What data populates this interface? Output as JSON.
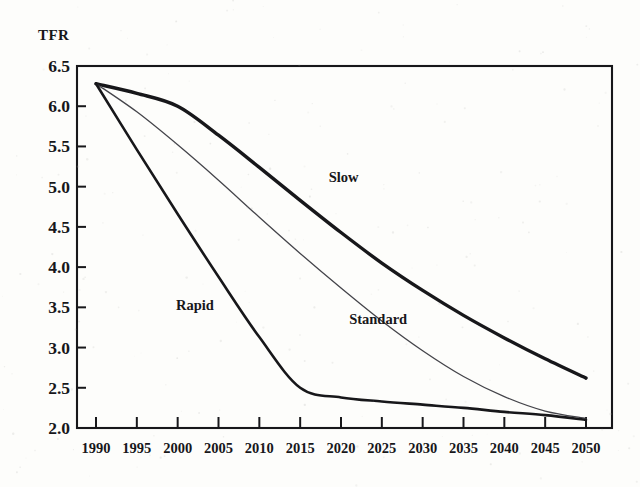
{
  "figure": {
    "background_color": "#fdfdfb",
    "ink_color": "#17171a",
    "axis_title": "TFR"
  },
  "chart_data": {
    "type": "line",
    "title": "",
    "subtitle": "",
    "xlabel": "",
    "ylabel": "TFR",
    "axis_title_position": "top-left",
    "grid": false,
    "legend": "inline-annotations",
    "xlim": [
      1990,
      2050
    ],
    "ylim": [
      2.0,
      6.5
    ],
    "x_ticks": [
      1990,
      1995,
      2000,
      2005,
      2010,
      2015,
      2020,
      2025,
      2030,
      2035,
      2040,
      2045,
      2050
    ],
    "x_tick_labels": [
      "1990",
      "1995",
      "2000",
      "2005",
      "2010",
      "2015",
      "2020",
      "2025",
      "2030",
      "2035",
      "2040",
      "2045",
      "2050"
    ],
    "y_ticks": [
      2.0,
      2.5,
      3.0,
      3.5,
      4.0,
      4.5,
      5.0,
      5.5,
      6.0,
      6.5
    ],
    "y_tick_labels": [
      "2.0",
      "2.5",
      "3.0",
      "3.5",
      "4.0",
      "4.5",
      "5.0",
      "5.5",
      "6.0",
      "6.5"
    ],
    "x": [
      1990,
      1995,
      2000,
      2005,
      2010,
      2015,
      2020,
      2025,
      2030,
      2035,
      2040,
      2045,
      2050
    ],
    "series": [
      {
        "name": "Slow",
        "label": "Slow",
        "style": "thick-solid",
        "line_width": 3.4,
        "color": "#17171a",
        "label_x": 2018.5,
        "label_y": 5.06,
        "values": [
          6.28,
          6.16,
          6.0,
          5.64,
          5.24,
          4.83,
          4.43,
          4.05,
          3.71,
          3.4,
          3.12,
          2.86,
          2.62
        ]
      },
      {
        "name": "Standard",
        "label": "Standard",
        "style": "thin-solid",
        "line_width": 1.3,
        "color": "#44444a",
        "label_x": 2021.0,
        "label_y": 3.29,
        "values": [
          6.28,
          5.93,
          5.52,
          5.08,
          4.62,
          4.17,
          3.74,
          3.33,
          2.96,
          2.64,
          2.39,
          2.21,
          2.12
        ]
      },
      {
        "name": "Rapid",
        "label": "Rapid",
        "style": "medium-solid",
        "line_width": 2.6,
        "color": "#17171a",
        "label_x": 1999.8,
        "label_y": 3.47,
        "values": [
          6.28,
          5.46,
          4.66,
          3.88,
          3.13,
          2.5,
          2.38,
          2.33,
          2.29,
          2.25,
          2.2,
          2.16,
          2.1
        ]
      }
    ]
  }
}
